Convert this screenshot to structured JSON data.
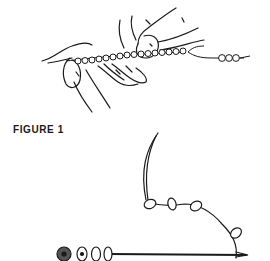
{
  "document": {
    "figure_caption": "FIGURE 1",
    "illustrations": [
      {
        "id": "top",
        "depicts": "hands-holding-beaded-string-with-thread-continuing-to-three-beads"
      },
      {
        "id": "bottom",
        "depicts": "beads-on-needle-with-thread-looping-through-spacer-beads"
      }
    ],
    "colors": {
      "ink": "#1a1a1a",
      "background": "#ffffff",
      "bead_fill": "#555555"
    }
  }
}
